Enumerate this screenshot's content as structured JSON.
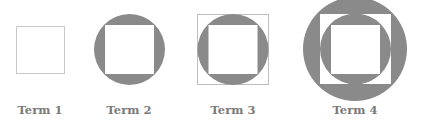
{
  "diagram": {
    "colors": {
      "fill": "#8a8a8a",
      "outline": "#bdbdbd",
      "background": "#ffffff"
    },
    "terms": [
      {
        "label": "Term 1",
        "description": "square outline"
      },
      {
        "label": "Term 2",
        "description": "circle with inscribed square"
      },
      {
        "label": "Term 3",
        "description": "square circumscribing circle with inscribed square"
      },
      {
        "label": "Term 4",
        "description": "circle circumscribing square, circle, and inscribed square"
      }
    ]
  }
}
